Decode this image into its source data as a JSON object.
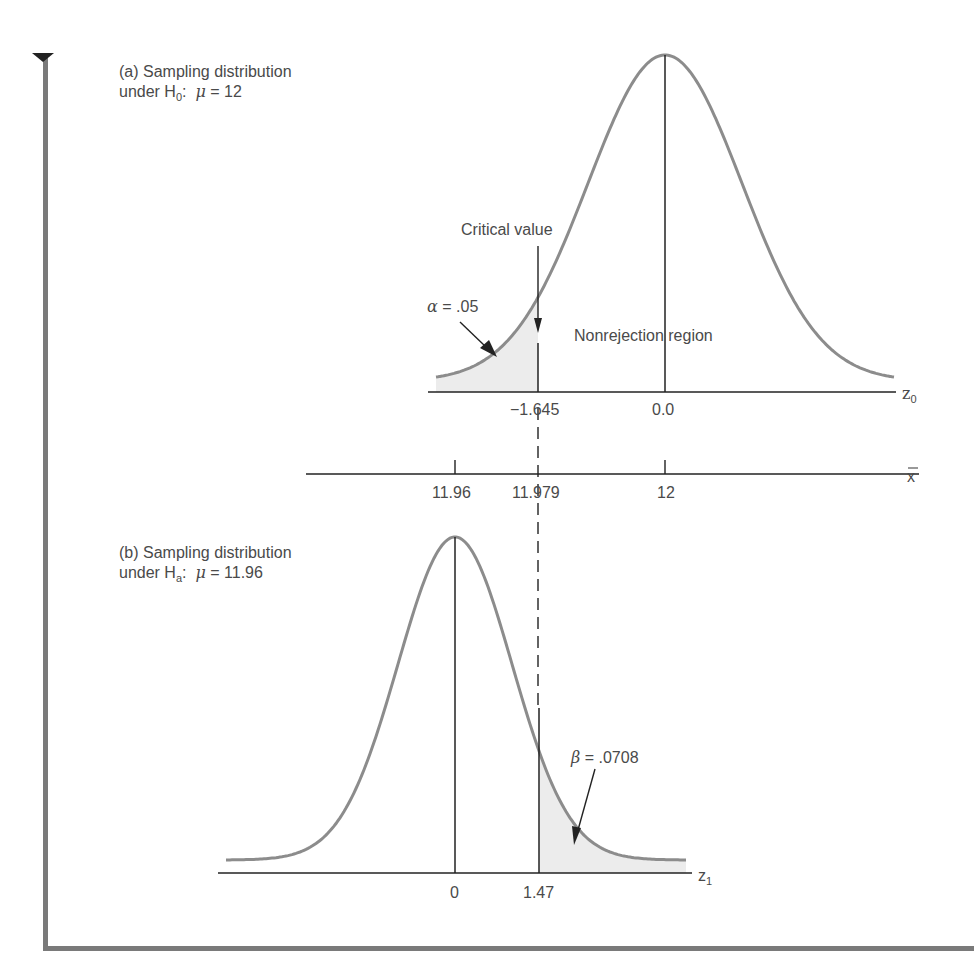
{
  "chart_data": [
    {
      "type": "area",
      "title": "(a) Sampling distribution under H0: μ = 12",
      "panel": "a",
      "distribution": "normal",
      "mean_z": 0.0,
      "axis_label": "z0",
      "ticks": [
        -1.645,
        0.0
      ],
      "tick_labels": [
        "−1.645",
        "0.0"
      ],
      "shaded_region": {
        "from": "-inf",
        "to": -1.645,
        "label": "α = .05",
        "value": 0.05
      },
      "annotations": [
        "Critical value",
        "Nonrejection region",
        "α = .05"
      ]
    },
    {
      "type": "line",
      "title": "x̄ axis",
      "axis_label": "x̄",
      "ticks": [
        11.96,
        11.979,
        12
      ],
      "tick_labels": [
        "11.96",
        "11.979",
        "12"
      ]
    },
    {
      "type": "area",
      "title": "(b) Sampling distribution under Ha: μ = 11.96",
      "panel": "b",
      "distribution": "normal",
      "mean_z": 0,
      "axis_label": "z1",
      "ticks": [
        0,
        1.47
      ],
      "tick_labels": [
        "0",
        "1.47"
      ],
      "shaded_region": {
        "from": 1.47,
        "to": "inf",
        "label": "β = .0708",
        "value": 0.0708
      },
      "annotations": [
        "β = .0708"
      ]
    }
  ],
  "panel_a": {
    "title_line1": "(a) Sampling distribution",
    "title_line2_prefix": "under H",
    "title_line2_sub": "0",
    "title_line2_mu": "μ",
    "title_line2_value": "= 12",
    "critical_label": "Critical value",
    "alpha_symbol": "α",
    "alpha_value": "= .05",
    "nonrejection_label": "Nonrejection region",
    "tick_crit": "−1.645",
    "tick_zero": "0.0",
    "axis_var": "z",
    "axis_sub": "0"
  },
  "xbar_axis": {
    "tick1": "11.96",
    "tick2": "11.979",
    "tick3": "12",
    "axis_var": "x"
  },
  "panel_b": {
    "title_line1": "(b) Sampling distribution",
    "title_line2_prefix": "under H",
    "title_line2_sub": "a",
    "title_line2_mu": "μ",
    "title_line2_value": "= 11.96",
    "beta_symbol": "β",
    "beta_value": "= .0708",
    "tick_zero": "0",
    "tick_crit": "1.47",
    "axis_var": "z",
    "axis_sub": "1"
  },
  "colors": {
    "curve": "#8c8c8c",
    "shade": "#ececec",
    "axis": "#222222",
    "frame": "#777777"
  }
}
